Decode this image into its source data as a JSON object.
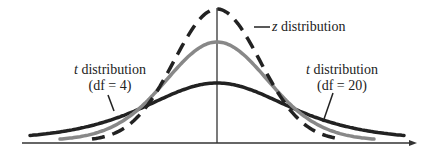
{
  "chart_data": {
    "type": "line",
    "title": "",
    "xlabel": "",
    "ylabel": "",
    "grid": false,
    "legend": "none (inline callout labels)",
    "series": [
      {
        "name": "z distribution",
        "style": "dashed",
        "color": "#222222",
        "peak_height": 0.399,
        "tail_extent": [
          -2.6,
          2.6
        ]
      },
      {
        "name": "t distribution (df = 20)",
        "style": "solid",
        "color": "#888888",
        "peak_height": 0.394,
        "tail_extent": [
          -3.3,
          3.3
        ]
      },
      {
        "name": "t distribution (df = 4)",
        "style": "solid",
        "color": "#222222",
        "peak_height": 0.375,
        "tail_extent": [
          -4.1,
          4.1
        ]
      }
    ],
    "annotations": [
      "z distribution",
      "t distribution (df = 4)",
      "t distribution (df = 20)"
    ]
  },
  "labels": {
    "z": {
      "var": "z",
      "text": " distribution"
    },
    "t_left": {
      "var": "t",
      "text": " distribution",
      "df": "(df = 4)"
    },
    "t_right": {
      "var": "t",
      "text": " distribution",
      "df": "(df = 20)"
    }
  },
  "colors": {
    "dark": "#222222",
    "grey": "#888888",
    "axis": "#333333"
  }
}
